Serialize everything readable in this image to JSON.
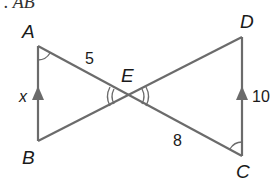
{
  "header": {
    "text": ". AB"
  },
  "diagram": {
    "type": "two triangles sharing vertex E (bowtie)",
    "points": {
      "A": {
        "label": "A"
      },
      "B": {
        "label": "B"
      },
      "C": {
        "label": "C"
      },
      "D": {
        "label": "D"
      },
      "E": {
        "label": "E"
      }
    },
    "segments": {
      "AE": {
        "label": "5"
      },
      "EC": {
        "label": "8"
      },
      "AB": {
        "label": "x"
      },
      "DC": {
        "label": "10"
      }
    },
    "markers": {
      "parallel": "AB ∥ DC (arrow marks)",
      "angle_A_C": "single arc, congruent angles at A and C",
      "angle_E": "double arcs, vertical angles at E"
    },
    "colors": {
      "line": "#6b6b6b",
      "text": "#1a1a1a"
    }
  }
}
